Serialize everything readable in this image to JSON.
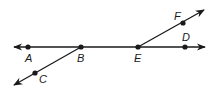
{
  "colors": {
    "ink": "#1a1a1a",
    "background": "#ffffff"
  },
  "lines": [
    {
      "id": "line-AD",
      "type": "line",
      "x1": 14,
      "y1": 47,
      "x2": 205,
      "y2": 47,
      "arrow_start": true,
      "arrow_end": true
    },
    {
      "id": "ray-BC",
      "type": "ray",
      "x1": 81,
      "y1": 47,
      "x2": 14,
      "y2": 85,
      "arrow_end": true
    },
    {
      "id": "ray-EF",
      "type": "ray",
      "x1": 138,
      "y1": 47,
      "x2": 204,
      "y2": 10,
      "arrow_end": true
    }
  ],
  "points": [
    {
      "name": "A",
      "x": 28,
      "y": 47,
      "label_x": 25,
      "label_y": 62
    },
    {
      "name": "B",
      "x": 81,
      "y": 47,
      "label_x": 77,
      "label_y": 62
    },
    {
      "name": "C",
      "x": 35,
      "y": 73,
      "label_x": 39,
      "label_y": 83
    },
    {
      "name": "E",
      "x": 138,
      "y": 47,
      "label_x": 134,
      "label_y": 62
    },
    {
      "name": "D",
      "x": 185,
      "y": 47,
      "label_x": 182,
      "label_y": 41
    },
    {
      "name": "F",
      "x": 183,
      "y": 23,
      "label_x": 174,
      "label_y": 20
    }
  ]
}
